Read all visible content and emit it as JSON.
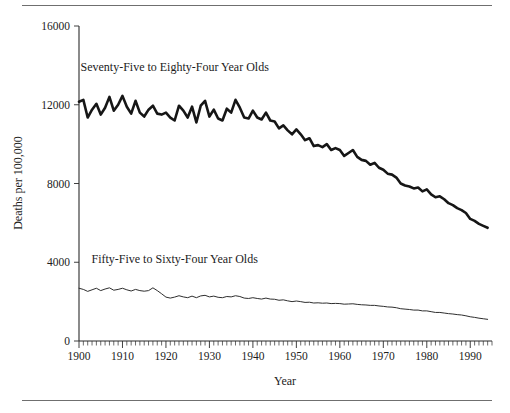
{
  "chart_data": {
    "type": "line",
    "title": "",
    "subtitle": "",
    "xlabel": "Year",
    "ylabel": "Deaths per 100,000",
    "xlim": [
      1900,
      1995
    ],
    "ylim": [
      0,
      16000
    ],
    "grid": false,
    "legend_position": "inline-annotation",
    "xticks": [
      1900,
      1910,
      1920,
      1930,
      1940,
      1950,
      1960,
      1970,
      1980,
      1990
    ],
    "xticklabels": [
      "1900",
      "1910",
      "1920",
      "1930",
      "1940",
      "1950",
      "1960",
      "1970",
      "1980",
      "1990"
    ],
    "yticks": [
      0,
      4000,
      8000,
      12000,
      16000
    ],
    "yticklabels": [
      "0",
      "4000",
      "8000",
      "12000",
      "16000"
    ],
    "minor_xtick_interval": 1,
    "annotations": [
      {
        "text": "Seventy-Five to Eighty-Four Year Olds",
        "x": 1922,
        "y": 13700
      },
      {
        "text": "Fifty-Five to Sixty-Four Year Olds",
        "x": 1922,
        "y": 3950
      }
    ],
    "series": [
      {
        "name": "Seventy-Five to Eighty-Four Year Olds",
        "color": "#161616",
        "linewidth": 2.6,
        "x": [
          1900,
          1901,
          1902,
          1903,
          1904,
          1905,
          1906,
          1907,
          1908,
          1909,
          1910,
          1911,
          1912,
          1913,
          1914,
          1915,
          1916,
          1917,
          1918,
          1919,
          1920,
          1921,
          1922,
          1923,
          1924,
          1925,
          1926,
          1927,
          1928,
          1929,
          1930,
          1931,
          1932,
          1933,
          1934,
          1935,
          1936,
          1937,
          1938,
          1939,
          1940,
          1941,
          1942,
          1943,
          1944,
          1945,
          1946,
          1947,
          1948,
          1949,
          1950,
          1951,
          1952,
          1953,
          1954,
          1955,
          1956,
          1957,
          1958,
          1959,
          1960,
          1961,
          1962,
          1963,
          1964,
          1965,
          1966,
          1967,
          1968,
          1969,
          1970,
          1971,
          1972,
          1973,
          1974,
          1975,
          1976,
          1977,
          1978,
          1979,
          1980,
          1981,
          1982,
          1983,
          1984,
          1985,
          1986,
          1987,
          1988,
          1989,
          1990,
          1991,
          1992,
          1993,
          1994
        ],
        "values": [
          12150,
          12250,
          11350,
          11750,
          12050,
          11500,
          11850,
          12400,
          11700,
          12000,
          12450,
          11900,
          11550,
          12200,
          11600,
          11400,
          11750,
          11950,
          11550,
          11500,
          11600,
          11350,
          11200,
          11950,
          11700,
          11350,
          11900,
          11100,
          11950,
          12200,
          11400,
          11750,
          11300,
          11200,
          11800,
          11600,
          12250,
          11850,
          11350,
          11300,
          11700,
          11350,
          11250,
          11600,
          11200,
          11150,
          10800,
          10950,
          10700,
          10500,
          10750,
          10500,
          10200,
          10300,
          9900,
          9950,
          9850,
          10000,
          9700,
          9800,
          9700,
          9400,
          9550,
          9700,
          9350,
          9200,
          9150,
          8950,
          9050,
          8800,
          8700,
          8500,
          8450,
          8300,
          8000,
          7900,
          7850,
          7750,
          7800,
          7600,
          7700,
          7450,
          7300,
          7350,
          7200,
          7000,
          6900,
          6750,
          6650,
          6500,
          6200,
          6100,
          5950,
          5850,
          5750
        ],
        "y_units": "deaths per 100,000"
      },
      {
        "name": "Fifty-Five to Sixty-Four Year Olds",
        "color": "#2e2e2e",
        "linewidth": 1.0,
        "x": [
          1900,
          1901,
          1902,
          1903,
          1904,
          1905,
          1906,
          1907,
          1908,
          1909,
          1910,
          1911,
          1912,
          1913,
          1914,
          1915,
          1916,
          1917,
          1918,
          1919,
          1920,
          1921,
          1922,
          1923,
          1924,
          1925,
          1926,
          1927,
          1928,
          1929,
          1930,
          1931,
          1932,
          1933,
          1934,
          1935,
          1936,
          1937,
          1938,
          1939,
          1940,
          1941,
          1942,
          1943,
          1944,
          1945,
          1946,
          1947,
          1948,
          1949,
          1950,
          1951,
          1952,
          1953,
          1954,
          1955,
          1956,
          1957,
          1958,
          1959,
          1960,
          1961,
          1962,
          1963,
          1964,
          1965,
          1966,
          1967,
          1968,
          1969,
          1970,
          1971,
          1972,
          1973,
          1974,
          1975,
          1976,
          1977,
          1978,
          1979,
          1980,
          1981,
          1982,
          1983,
          1984,
          1985,
          1986,
          1987,
          1988,
          1989,
          1990,
          1991,
          1992,
          1993,
          1994
        ],
        "values": [
          2680,
          2620,
          2520,
          2600,
          2680,
          2560,
          2640,
          2700,
          2580,
          2620,
          2680,
          2600,
          2540,
          2620,
          2560,
          2530,
          2560,
          2700,
          2560,
          2400,
          2230,
          2180,
          2230,
          2300,
          2240,
          2200,
          2280,
          2200,
          2290,
          2320,
          2240,
          2280,
          2220,
          2200,
          2260,
          2240,
          2300,
          2260,
          2180,
          2160,
          2200,
          2160,
          2130,
          2180,
          2130,
          2120,
          2070,
          2090,
          2040,
          2000,
          2030,
          2000,
          1960,
          1970,
          1930,
          1940,
          1920,
          1930,
          1900,
          1910,
          1900,
          1870,
          1880,
          1890,
          1860,
          1840,
          1830,
          1810,
          1810,
          1780,
          1760,
          1730,
          1720,
          1690,
          1640,
          1620,
          1600,
          1570,
          1570,
          1530,
          1530,
          1490,
          1450,
          1450,
          1420,
          1390,
          1370,
          1340,
          1320,
          1280,
          1230,
          1200,
          1160,
          1130,
          1100
        ],
        "y_units": "deaths per 100,000"
      }
    ]
  },
  "figure": {
    "top_rule": "horizontal-rule",
    "bottom_rule": "horizontal-rule"
  }
}
